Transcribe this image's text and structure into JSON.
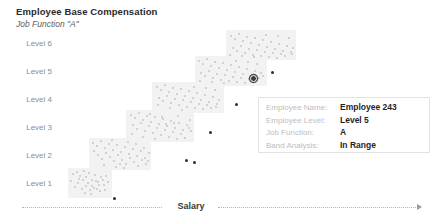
{
  "header": {
    "title": "Employee Base Compensation",
    "subtitle": "Job Function \"A\""
  },
  "axis": {
    "x_title": "Salary",
    "arrow_icon": "arrow-right-icon"
  },
  "tooltip": {
    "rows": [
      {
        "label": "Employee Name:",
        "value": "Employee 243"
      },
      {
        "label": "Employee Level:",
        "value": "Level 5"
      },
      {
        "label": "Job Function:",
        "value": "A"
      },
      {
        "label": "Band Analysis:",
        "value": "In Range"
      }
    ]
  },
  "colors": {
    "band": "#f2f2f2",
    "point": "#c6c6c6",
    "point_out_of_range": "#2e2e2e",
    "point_selected": "#3a3a3a",
    "axis": "#b4b4b4",
    "label": "#8d8d8d"
  },
  "chart_data": {
    "type": "scatter",
    "title": "Employee Base Compensation",
    "subtitle": "Job Function \"A\"",
    "xlabel": "Salary",
    "ylabel": "",
    "grid": false,
    "legend": null,
    "categories": [
      "Level 1",
      "Level 2",
      "Level 3",
      "Level 4",
      "Level 5",
      "Level 6"
    ],
    "y_tick_labels": [
      "Level 6",
      "Level 5",
      "Level 4",
      "Level 3",
      "Level 2",
      "Level 1"
    ],
    "bands": [
      {
        "level": "Level 1",
        "x": 68,
        "y": 138,
        "width": 44,
        "height": 30
      },
      {
        "level": "Level 2",
        "x": 89,
        "y": 108,
        "width": 62,
        "height": 32
      },
      {
        "level": "Level 3",
        "x": 126,
        "y": 80,
        "width": 68,
        "height": 32
      },
      {
        "level": "Level 4",
        "x": 152,
        "y": 52,
        "width": 72,
        "height": 31
      },
      {
        "level": "Level 5",
        "x": 195,
        "y": 26,
        "width": 72,
        "height": 30
      },
      {
        "level": "Level 6",
        "x": 226,
        "y": 0,
        "width": 70,
        "height": 30
      }
    ],
    "selected_point": {
      "name": "Employee 243",
      "level": "Level 5",
      "x": 253,
      "y": 48
    },
    "series": [
      {
        "name": "In Range",
        "color": "#c6c6c6",
        "points": [
          [
            73,
            144
          ],
          [
            77,
            142
          ],
          [
            80,
            146
          ],
          [
            84,
            141
          ],
          [
            86,
            147
          ],
          [
            89,
            143
          ],
          [
            92,
            150
          ],
          [
            95,
            145
          ],
          [
            98,
            152
          ],
          [
            101,
            147
          ],
          [
            104,
            155
          ],
          [
            94,
            158
          ],
          [
            90,
            160
          ],
          [
            86,
            156
          ],
          [
            82,
            159
          ],
          [
            78,
            153
          ],
          [
            75,
            157
          ],
          [
            83,
            150
          ],
          [
            88,
            153
          ],
          [
            92,
            156
          ],
          [
            97,
            159
          ],
          [
            100,
            161
          ],
          [
            103,
            150
          ],
          [
            106,
            146
          ],
          [
            79,
            149
          ],
          [
            85,
            163
          ],
          [
            91,
            164
          ],
          [
            96,
            151
          ],
          [
            99,
            155
          ],
          [
            71,
            151
          ],
          [
            108,
            152
          ],
          [
            105,
            160
          ],
          [
            93,
            113
          ],
          [
            97,
            116
          ],
          [
            101,
            111
          ],
          [
            105,
            118
          ],
          [
            109,
            114
          ],
          [
            113,
            120
          ],
          [
            117,
            115
          ],
          [
            121,
            122
          ],
          [
            125,
            117
          ],
          [
            129,
            124
          ],
          [
            133,
            119
          ],
          [
            137,
            126
          ],
          [
            141,
            121
          ],
          [
            145,
            128
          ],
          [
            149,
            123
          ],
          [
            94,
            121
          ],
          [
            98,
            125
          ],
          [
            102,
            129
          ],
          [
            106,
            123
          ],
          [
            110,
            127
          ],
          [
            114,
            131
          ],
          [
            118,
            125
          ],
          [
            122,
            130
          ],
          [
            126,
            134
          ],
          [
            130,
            128
          ],
          [
            134,
            132
          ],
          [
            138,
            136
          ],
          [
            142,
            130
          ],
          [
            146,
            134
          ],
          [
            112,
            110
          ],
          [
            120,
            134
          ],
          [
            128,
            112
          ],
          [
            136,
            114
          ],
          [
            144,
            118
          ],
          [
            148,
            131
          ],
          [
            104,
            135
          ],
          [
            116,
            137
          ],
          [
            124,
            138
          ],
          [
            131,
            85
          ],
          [
            135,
            88
          ],
          [
            139,
            83
          ],
          [
            143,
            90
          ],
          [
            147,
            86
          ],
          [
            151,
            92
          ],
          [
            155,
            87
          ],
          [
            159,
            94
          ],
          [
            163,
            89
          ],
          [
            167,
            96
          ],
          [
            171,
            91
          ],
          [
            175,
            98
          ],
          [
            179,
            93
          ],
          [
            183,
            100
          ],
          [
            187,
            95
          ],
          [
            191,
            101
          ],
          [
            133,
            95
          ],
          [
            137,
            99
          ],
          [
            141,
            93
          ],
          [
            145,
            101
          ],
          [
            149,
            96
          ],
          [
            153,
            103
          ],
          [
            157,
            98
          ],
          [
            161,
            105
          ],
          [
            165,
            100
          ],
          [
            169,
            107
          ],
          [
            173,
            102
          ],
          [
            177,
            109
          ],
          [
            181,
            104
          ],
          [
            185,
            108
          ],
          [
            189,
            98
          ],
          [
            132,
            104
          ],
          [
            143,
            107
          ],
          [
            155,
            109
          ],
          [
            166,
            94
          ],
          [
            178,
            86
          ],
          [
            190,
            90
          ],
          [
            150,
            84
          ],
          [
            162,
            87
          ],
          [
            174,
            93
          ],
          [
            157,
            57
          ],
          [
            161,
            60
          ],
          [
            165,
            55
          ],
          [
            169,
            62
          ],
          [
            173,
            58
          ],
          [
            177,
            64
          ],
          [
            181,
            59
          ],
          [
            185,
            66
          ],
          [
            189,
            61
          ],
          [
            193,
            68
          ],
          [
            197,
            63
          ],
          [
            201,
            70
          ],
          [
            205,
            65
          ],
          [
            209,
            72
          ],
          [
            213,
            67
          ],
          [
            217,
            74
          ],
          [
            159,
            68
          ],
          [
            163,
            71
          ],
          [
            167,
            66
          ],
          [
            171,
            73
          ],
          [
            175,
            69
          ],
          [
            179,
            75
          ],
          [
            183,
            70
          ],
          [
            187,
            77
          ],
          [
            191,
            72
          ],
          [
            195,
            78
          ],
          [
            199,
            74
          ],
          [
            203,
            79
          ],
          [
            207,
            75
          ],
          [
            211,
            78
          ],
          [
            215,
            60
          ],
          [
            219,
            70
          ],
          [
            158,
            75
          ],
          [
            170,
            78
          ],
          [
            182,
            80
          ],
          [
            194,
            57
          ],
          [
            206,
            58
          ],
          [
            216,
            77
          ],
          [
            199,
            31
          ],
          [
            203,
            34
          ],
          [
            207,
            29
          ],
          [
            211,
            36
          ],
          [
            215,
            32
          ],
          [
            219,
            38
          ],
          [
            223,
            33
          ],
          [
            227,
            40
          ],
          [
            231,
            35
          ],
          [
            235,
            42
          ],
          [
            239,
            37
          ],
          [
            243,
            44
          ],
          [
            247,
            39
          ],
          [
            251,
            46
          ],
          [
            255,
            41
          ],
          [
            259,
            48
          ],
          [
            201,
            43
          ],
          [
            205,
            46
          ],
          [
            209,
            41
          ],
          [
            213,
            48
          ],
          [
            217,
            44
          ],
          [
            221,
            50
          ],
          [
            225,
            45
          ],
          [
            229,
            51
          ],
          [
            233,
            47
          ],
          [
            237,
            52
          ],
          [
            241,
            48
          ],
          [
            245,
            53
          ],
          [
            249,
            49
          ],
          [
            253,
            52
          ],
          [
            257,
            34
          ],
          [
            261,
            43
          ],
          [
            200,
            51
          ],
          [
            212,
            52
          ],
          [
            224,
            53
          ],
          [
            236,
            31
          ],
          [
            248,
            32
          ],
          [
            263,
            46
          ],
          [
            231,
            6
          ],
          [
            235,
            9
          ],
          [
            239,
            4
          ],
          [
            243,
            11
          ],
          [
            247,
            7
          ],
          [
            251,
            13
          ],
          [
            255,
            8
          ],
          [
            259,
            15
          ],
          [
            263,
            10
          ],
          [
            267,
            17
          ],
          [
            271,
            12
          ],
          [
            275,
            19
          ],
          [
            279,
            14
          ],
          [
            283,
            21
          ],
          [
            287,
            16
          ],
          [
            291,
            22
          ],
          [
            233,
            18
          ],
          [
            237,
            21
          ],
          [
            241,
            16
          ],
          [
            245,
            23
          ],
          [
            249,
            19
          ],
          [
            253,
            25
          ],
          [
            257,
            20
          ],
          [
            261,
            26
          ],
          [
            265,
            22
          ],
          [
            269,
            27
          ],
          [
            273,
            23
          ],
          [
            277,
            28
          ],
          [
            281,
            24
          ],
          [
            285,
            26
          ],
          [
            289,
            8
          ],
          [
            293,
            18
          ],
          [
            230,
            25
          ],
          [
            242,
            26
          ],
          [
            254,
            27
          ],
          [
            266,
            5
          ],
          [
            278,
            6
          ],
          [
            292,
            24
          ]
        ]
      },
      {
        "name": "Out of Range",
        "color": "#2e2e2e",
        "points": [
          [
            114,
            168
          ],
          [
            186,
            130
          ],
          [
            194,
            132
          ],
          [
            210,
            102
          ],
          [
            236,
            74
          ],
          [
            272,
            42
          ]
        ]
      }
    ]
  }
}
